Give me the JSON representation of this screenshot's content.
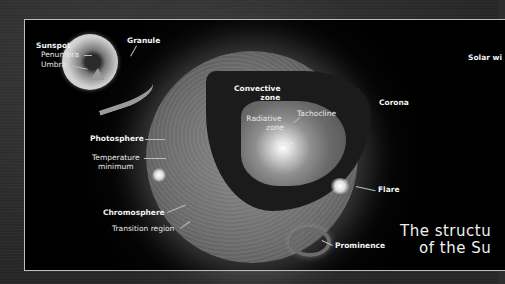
{
  "diagram": {
    "title_line1": "The structu",
    "title_line2": "of the Su",
    "labels": {
      "sunspot": "Sunspot",
      "penumbra": "Penumbra",
      "umbra": "Umbra",
      "granule": "Granule",
      "solar_wind": "Solar wi",
      "corona": "Corona",
      "convective_zone_1": "Convective",
      "convective_zone_2": "zone",
      "tachocline": "Tachocline",
      "radiative_zone_1": "Radiative",
      "radiative_zone_2": "zone",
      "core": "Core",
      "photosphere": "Photosphere",
      "temperature_minimum_1": "Temperature",
      "temperature_minimum_2": "minimum",
      "chromosphere": "Chromosphere",
      "transition_region": "Transition region",
      "flare": "Flare",
      "prominence": "Prominence"
    }
  },
  "colors": {
    "frame": "#2e2e2e",
    "panel": "#000000",
    "border": "#bdbdbd",
    "text": "#e8e8e8"
  }
}
